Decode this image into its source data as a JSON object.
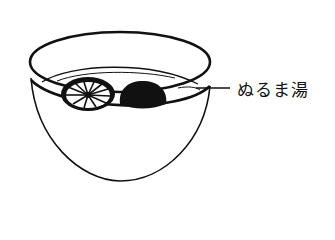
{
  "illustration": {
    "subject": "bowl-of-soaking-shiitake",
    "label": "ぬるま湯",
    "stroke_color": "#111111",
    "background": "#ffffff"
  }
}
